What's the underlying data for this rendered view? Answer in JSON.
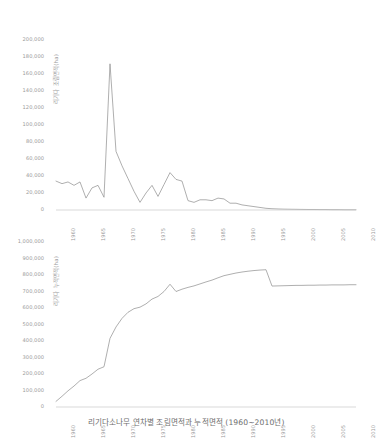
{
  "caption": "리기다소나무 연차별 조림면적과 누적면적 (1960~2010년)",
  "colors": {
    "line": "#8c8c8c",
    "axis": "#c9c9c9",
    "text": "#9a9a9a",
    "caption": "#6e6e6e",
    "background": "#ffffff"
  },
  "chart_data": [
    {
      "type": "line",
      "title": "",
      "xlabel": "",
      "ylabel": "리기다 조림면적(ha)",
      "xlim": [
        1960,
        2010
      ],
      "ylim": [
        0,
        200000
      ],
      "grid": false,
      "legend": "none",
      "ytick_labels": [
        "200,000",
        "180,000",
        "160,000",
        "140,000",
        "120,000",
        "100,000",
        "80,000",
        "60,000",
        "40,000",
        "20,000",
        "0"
      ],
      "ytick_values": [
        200000,
        180000,
        160000,
        140000,
        120000,
        100000,
        80000,
        60000,
        40000,
        20000,
        0
      ],
      "xtick_labels": [
        "1960",
        "1965",
        "1970",
        "1975",
        "1980",
        "1985",
        "1990",
        "1995",
        "2000",
        "2005",
        "2010"
      ],
      "xtick_values": [
        1960,
        1965,
        1970,
        1975,
        1980,
        1985,
        1990,
        1995,
        2000,
        2005,
        2010
      ],
      "x": [
        1960,
        1961,
        1962,
        1963,
        1964,
        1965,
        1966,
        1967,
        1968,
        1969,
        1970,
        1971,
        1972,
        1973,
        1974,
        1975,
        1976,
        1977,
        1978,
        1979,
        1980,
        1981,
        1982,
        1983,
        1984,
        1985,
        1986,
        1987,
        1988,
        1989,
        1990,
        1991,
        1992,
        1993,
        1994,
        1995,
        1996,
        1997,
        1998,
        1999,
        2000,
        2001,
        2002,
        2003,
        2004,
        2005,
        2006,
        2007,
        2008,
        2009,
        2010
      ],
      "values": [
        34000,
        31000,
        33000,
        29000,
        33000,
        14000,
        26000,
        29000,
        15000,
        172000,
        69000,
        52000,
        37000,
        22000,
        9000,
        20000,
        29000,
        16000,
        30000,
        44000,
        36000,
        34000,
        11000,
        9000,
        12000,
        12000,
        11000,
        14000,
        13000,
        8000,
        8000,
        6000,
        5000,
        4000,
        3000,
        2000,
        1500,
        1200,
        1000,
        900,
        800,
        700,
        600,
        600,
        500,
        500,
        400,
        400,
        300,
        300,
        300
      ]
    },
    {
      "type": "line",
      "title": "",
      "xlabel": "",
      "ylabel": "리기다 누적면적(ha)",
      "xlim": [
        1960,
        2010
      ],
      "ylim": [
        0,
        1000000
      ],
      "grid": false,
      "legend": "none",
      "ytick_labels": [
        "1,000,000",
        "900,000",
        "800,000",
        "700,000",
        "600,000",
        "500,000",
        "400,000",
        "300,000",
        "200,000",
        "100,000",
        "0"
      ],
      "ytick_values": [
        1000000,
        900000,
        800000,
        700000,
        600000,
        500000,
        400000,
        300000,
        200000,
        100000,
        0
      ],
      "xtick_labels": [
        "1960",
        "1965",
        "1970",
        "1975",
        "1980",
        "1985",
        "1990",
        "1995",
        "2000",
        "2005",
        "2010"
      ],
      "xtick_values": [
        1960,
        1965,
        1970,
        1975,
        1980,
        1985,
        1990,
        1995,
        2000,
        2005,
        2010
      ],
      "x": [
        1960,
        1961,
        1962,
        1963,
        1964,
        1965,
        1966,
        1967,
        1968,
        1969,
        1970,
        1971,
        1972,
        1973,
        1974,
        1975,
        1976,
        1977,
        1978,
        1979,
        1980,
        1981,
        1982,
        1983,
        1984,
        1985,
        1986,
        1987,
        1988,
        1989,
        1990,
        1991,
        1992,
        1993,
        1994,
        1995,
        1996,
        1997,
        1998,
        1999,
        2000,
        2001,
        2002,
        2003,
        2004,
        2005,
        2006,
        2007,
        2008,
        2009,
        2010
      ],
      "values": [
        34000,
        65000,
        98000,
        127000,
        160000,
        174000,
        200000,
        229000,
        244000,
        416000,
        485000,
        537000,
        574000,
        596000,
        605000,
        625000,
        654000,
        670000,
        700000,
        744000,
        700000,
        714000,
        725000,
        734000,
        746000,
        758000,
        769000,
        783000,
        796000,
        804000,
        812000,
        818000,
        823000,
        827000,
        830000,
        832000,
        733000,
        734000,
        735000,
        736000,
        737000,
        737000,
        738000,
        738000,
        739000,
        739000,
        740000,
        740000,
        740000,
        741000,
        741000
      ]
    }
  ]
}
